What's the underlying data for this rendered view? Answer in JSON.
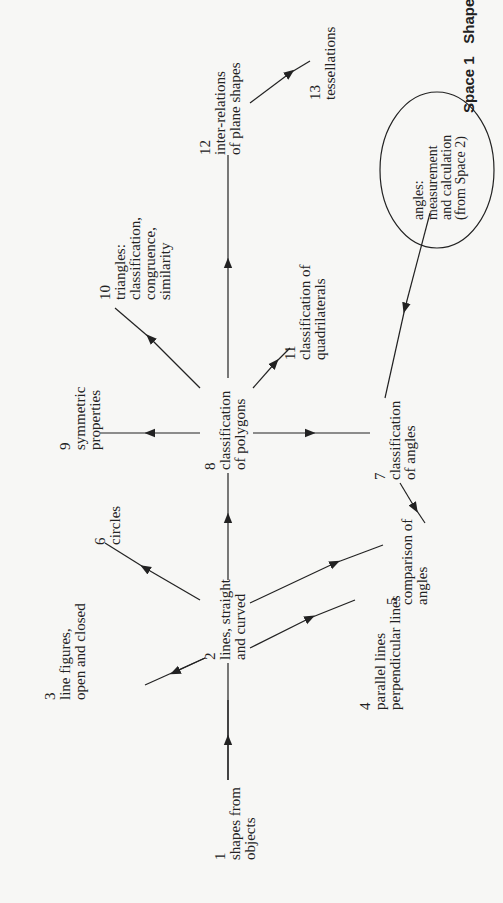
{
  "header": {
    "space": "Space 1",
    "title": "Shape"
  },
  "nodes": [
    {
      "id": 1,
      "num": "1",
      "lines": [
        "shapes from",
        "objects"
      ]
    },
    {
      "id": 2,
      "num": "2",
      "lines": [
        "lines, straight",
        "and curved"
      ]
    },
    {
      "id": 3,
      "num": "3",
      "lines": [
        "line figures,",
        "open and closed"
      ]
    },
    {
      "id": 4,
      "num": "4",
      "lines": [
        "parallel lines",
        "perpendicular lines"
      ]
    },
    {
      "id": 5,
      "num": "5",
      "lines": [
        "comparison of",
        "angles"
      ]
    },
    {
      "id": 6,
      "num": "6",
      "lines": [
        "circles"
      ]
    },
    {
      "id": 7,
      "num": "7",
      "lines": [
        "classification",
        "of angles"
      ]
    },
    {
      "id": 8,
      "num": "8",
      "lines": [
        "classification",
        "of polygons"
      ]
    },
    {
      "id": 9,
      "num": "9",
      "lines": [
        "symmetric",
        "properties"
      ]
    },
    {
      "id": 10,
      "num": "10",
      "lines": [
        "triangles:",
        "classification,",
        "congruence,",
        "similarity"
      ]
    },
    {
      "id": 11,
      "num": "11",
      "lines": [
        "classification of",
        "quadrilaterals"
      ]
    },
    {
      "id": 12,
      "num": "12",
      "lines": [
        "inter-relations",
        "of plane shapes"
      ]
    },
    {
      "id": 13,
      "num": "13",
      "lines": [
        "tessellations"
      ]
    }
  ],
  "external": {
    "lines": [
      "angles:",
      "measurement",
      "and calculation",
      "(from Space 2)"
    ]
  },
  "edges": [
    {
      "from": 1,
      "to": 2
    },
    {
      "from": 2,
      "to": 3
    },
    {
      "from": 2,
      "to": 4
    },
    {
      "from": 2,
      "to": 5
    },
    {
      "from": 2,
      "to": 6
    },
    {
      "from": 2,
      "to": 8
    },
    {
      "from": 8,
      "to": 9
    },
    {
      "from": 8,
      "to": 10
    },
    {
      "from": 8,
      "to": 11
    },
    {
      "from": 8,
      "to": 7
    },
    {
      "from": 8,
      "to": 12
    },
    {
      "from": 7,
      "to": 5
    },
    {
      "from": "external",
      "to": 7
    },
    {
      "from": 12,
      "to": 13
    }
  ]
}
